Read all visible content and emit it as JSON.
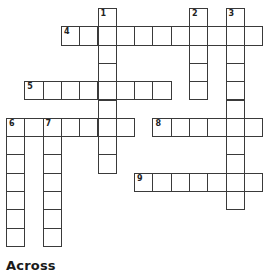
{
  "puzzle": {
    "cell_size": 18.3,
    "origin": {
      "x": 6,
      "y": 8
    },
    "colors": {
      "border": "#3a3a3a",
      "cell": "#ffffff",
      "text": "#222222"
    },
    "entries": [
      {
        "number": "1",
        "direction": "down",
        "row": 0,
        "col": 5,
        "length": 9
      },
      {
        "number": "2",
        "direction": "down",
        "row": 0,
        "col": 10,
        "length": 5
      },
      {
        "number": "3",
        "direction": "down",
        "row": 0,
        "col": 12,
        "length": 11
      },
      {
        "number": "4",
        "direction": "across",
        "row": 1,
        "col": 3,
        "length": 11
      },
      {
        "number": "5",
        "direction": "across",
        "row": 4,
        "col": 1,
        "length": 8
      },
      {
        "number": "6",
        "direction": "across",
        "row": 6,
        "col": 0,
        "length": 7
      },
      {
        "number": "6",
        "direction": "down",
        "row": 6,
        "col": 0,
        "length": 7
      },
      {
        "number": "7",
        "direction": "down",
        "row": 6,
        "col": 2,
        "length": 7
      },
      {
        "number": "8",
        "direction": "across",
        "row": 6,
        "col": 8,
        "length": 6
      },
      {
        "number": "9",
        "direction": "across",
        "row": 9,
        "col": 7,
        "length": 7
      }
    ]
  },
  "clues": {
    "across_heading": "Across"
  }
}
